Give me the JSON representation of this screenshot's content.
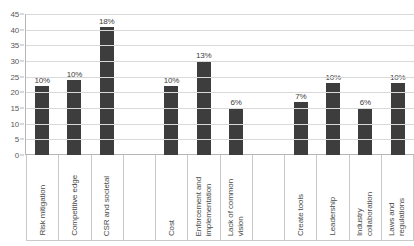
{
  "chart_data": {
    "type": "bar",
    "title": "",
    "xlabel": "",
    "ylabel": "",
    "ylim": [
      0,
      45
    ],
    "ytick_step": 5,
    "yticks": [
      "45",
      "40",
      "35",
      "30",
      "25",
      "20",
      "15",
      "10",
      "5",
      "0"
    ],
    "grid": true,
    "legend": false,
    "bar_color": "#3d3d3d",
    "categories": [
      "Risk mitigation",
      "Competitive edge",
      "CSR and societal",
      "",
      "Cost",
      "Enforcement and\nimplementation",
      "Lack of common\nvision",
      "",
      "Create tools",
      "Leadership",
      "Industry\ncollaboration",
      "Laws and\nregulations"
    ],
    "values": [
      22,
      24,
      41,
      null,
      22,
      30,
      15,
      null,
      17,
      23,
      15,
      23
    ],
    "data_labels": [
      "10%",
      "10%",
      "18%",
      "",
      "10%",
      "13%",
      "6%",
      "",
      "7%",
      "10%",
      "6%",
      "10%"
    ],
    "bars": [
      {
        "category": "Risk mitigation",
        "value": 22,
        "label": "10%"
      },
      {
        "category": "Competitive edge",
        "value": 24,
        "label": "10%"
      },
      {
        "category": "CSR and societal",
        "value": 41,
        "label": "18%"
      },
      {
        "category": "",
        "value": null,
        "label": ""
      },
      {
        "category": "Cost",
        "value": 22,
        "label": "10%"
      },
      {
        "category": "Enforcement and implementation",
        "value": 30,
        "label": "13%"
      },
      {
        "category": "Lack of common vision",
        "value": 15,
        "label": "6%"
      },
      {
        "category": "",
        "value": null,
        "label": ""
      },
      {
        "category": "Create tools",
        "value": 17,
        "label": "7%"
      },
      {
        "category": "Leadership",
        "value": 23,
        "label": "10%"
      },
      {
        "category": "Industry collaboration",
        "value": 15,
        "label": "6%"
      },
      {
        "category": "Laws and regulations",
        "value": 23,
        "label": "10%"
      }
    ]
  }
}
